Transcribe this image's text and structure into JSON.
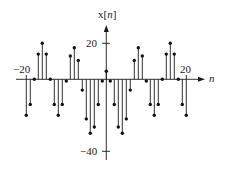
{
  "chart_data": {
    "type": "stem",
    "title": "",
    "ylabel": "x[n]",
    "xlabel": "n",
    "xlim": [
      -22,
      24
    ],
    "ylim": [
      -46,
      32
    ],
    "grid": false,
    "legend": null,
    "x_tick_labels": [
      {
        "value": -20,
        "label": "−20"
      },
      {
        "value": 20,
        "label": "20"
      }
    ],
    "y_tick_labels": [
      {
        "value": 20,
        "label": "20"
      },
      {
        "value": -40,
        "label": "−40"
      }
    ],
    "x": [
      -20,
      -19,
      -18,
      -17,
      -16,
      -15,
      -14,
      -13,
      -12,
      -11,
      -10,
      -9,
      -8,
      -7,
      -6,
      -5,
      -4,
      -3,
      -2,
      -1,
      0,
      1,
      2,
      3,
      4,
      5,
      6,
      7,
      8,
      9,
      10,
      11,
      12,
      13,
      14,
      15,
      16,
      17,
      18,
      19,
      20
    ],
    "values": [
      -20,
      -14,
      0,
      14,
      20,
      14,
      0,
      -14,
      -20,
      -14,
      -1,
      13,
      17.5,
      10.5,
      -6,
      -22,
      -30,
      -26.5,
      -14,
      -1,
      4.5,
      -1,
      -14,
      -26.5,
      -30,
      -22,
      -6,
      10.5,
      17.5,
      13,
      -1,
      -14,
      -20,
      -14,
      0,
      14,
      20,
      14,
      0,
      -14,
      -20
    ]
  },
  "labels": {
    "y_axis": "x[",
    "y_axis_var": "n",
    "y_axis_close": "]",
    "x_axis_var": "n",
    "x_tick_neg20": "−20",
    "x_tick_20": "20",
    "y_tick_20": "20",
    "y_tick_neg40": "−40"
  }
}
